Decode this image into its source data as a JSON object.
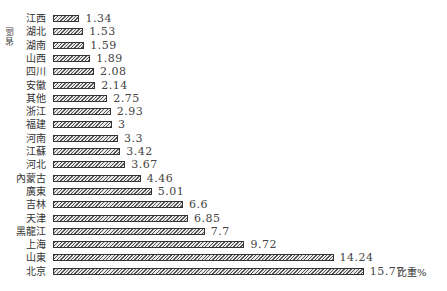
{
  "chart_data": {
    "type": "bar",
    "orientation": "horizontal",
    "title": "",
    "xlabel": "比重%",
    "ylabel": "省區",
    "categories": [
      "江西",
      "湖北",
      "湖南",
      "山西",
      "四川",
      "安徽",
      "其他",
      "浙江",
      "福建",
      "河南",
      "江蘇",
      "河北",
      "內蒙古",
      "廣東",
      "吉林",
      "天津",
      "黑龍江",
      "上海",
      "山東",
      "北京"
    ],
    "values": [
      1.34,
      1.53,
      1.59,
      1.89,
      2.08,
      2.14,
      2.75,
      2.93,
      3,
      3.3,
      3.42,
      3.67,
      4.46,
      5.01,
      6.6,
      6.85,
      7.7,
      9.72,
      14.24,
      15.77
    ],
    "value_labels": [
      "1.34",
      "1.53",
      "1.59",
      "1.89",
      "2.08",
      "2.14",
      "2.75",
      "2.93",
      "3",
      "3.3",
      "3.42",
      "3.67",
      "4.46",
      "5.01",
      "6.6",
      "6.85",
      "7.7",
      "9.72",
      "14.24",
      "15.77"
    ],
    "xlim": [
      0,
      16
    ],
    "grid": false,
    "legend": null,
    "bar_style": "hatched"
  }
}
